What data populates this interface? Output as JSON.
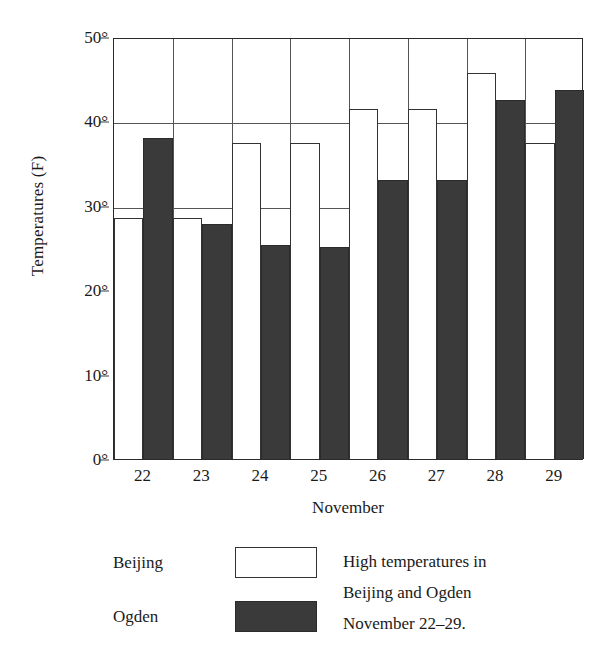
{
  "chart_data": {
    "type": "bar",
    "title": "",
    "categories": [
      "22",
      "23",
      "24",
      "25",
      "26",
      "27",
      "28",
      "29"
    ],
    "series": [
      {
        "name": "Beijing",
        "values": [
          28.5,
          28.5,
          37.5,
          37.5,
          41.5,
          41.5,
          45.7,
          37.5
        ]
      },
      {
        "name": "Ogden",
        "values": [
          38.0,
          27.8,
          25.3,
          25.1,
          33.0,
          33.0,
          42.5,
          43.7
        ]
      }
    ],
    "xlabel": "November",
    "ylabel": "Temperatures (F)",
    "ylim": [
      0,
      50
    ],
    "yticks": [
      0,
      10,
      20,
      30,
      40,
      50
    ],
    "ytick_labels": [
      "0°",
      "10°",
      "20°",
      "30°",
      "40°",
      "50°"
    ],
    "grid": "horizontal-and-vertical",
    "legend_position": "below-left"
  },
  "legend": {
    "entries": [
      {
        "label": "Beijing",
        "swatch": "white-outlined-rectangle",
        "color": "#ffffff"
      },
      {
        "label": "Ogden",
        "swatch": "solid-dark-rectangle",
        "color": "#3a3a3a"
      }
    ]
  },
  "caption": {
    "line1": "High temperatures in",
    "line2": "Beijing and Ogden",
    "line3": "November 22–29."
  }
}
